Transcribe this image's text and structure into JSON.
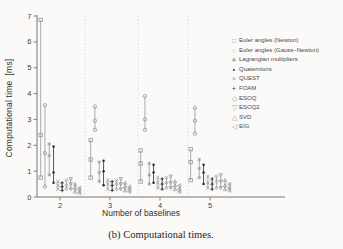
{
  "figure": {
    "caption": "(b) Computational times."
  },
  "chart_data": {
    "type": "scatter",
    "subtype": "errorbar (min / mean / max markers joined by vertical line, per algorithm, grouped by baseline count)",
    "title": "",
    "xlabel": "Number of baselines",
    "ylabel": "Computational time  [ms]",
    "caption": "(b) Computational times.",
    "categories": [
      2,
      3,
      4,
      5
    ],
    "x_ticks": [
      "2",
      "3",
      "4",
      "5"
    ],
    "y_ticks": [
      "0",
      "1",
      "2",
      "3",
      "4",
      "5",
      "6",
      "7"
    ],
    "ylim": [
      0,
      7
    ],
    "xlim": [
      1.55,
      6.5
    ],
    "grid": false,
    "separators_x": [
      2.5,
      3.56,
      4.56
    ],
    "legend_position": "outside upper right",
    "colors": {
      "background": "#fbfaf8",
      "axis": "#6a6a6a",
      "separator": "#bdbdbd",
      "gray_series": "#999999",
      "black_series": "#2b2b2b",
      "tick_label": "#3f3f3f"
    },
    "series": [
      {
        "name": "Euler angles (Newton)",
        "marker": "square",
        "shade": "gray",
        "points_min_mid_max": [
          [
            0.75,
            2.4,
            6.85
          ],
          [
            0.75,
            1.45,
            2.2
          ],
          [
            0.6,
            1.3,
            1.8
          ],
          [
            0.65,
            1.35,
            1.85
          ]
        ]
      },
      {
        "name": "Euler angles (Gauss–Newton)",
        "marker": "circle",
        "shade": "gray",
        "points_min_mid_max": [
          [
            0.4,
            1.7,
            3.55
          ],
          [
            2.6,
            2.95,
            3.5
          ],
          [
            2.6,
            3.0,
            3.9
          ],
          [
            2.45,
            2.95,
            3.45
          ]
        ]
      },
      {
        "name": "Lagrangian multipliers",
        "marker": "asterisk",
        "shade": "gray",
        "points_min_mid_max": [
          [
            0.85,
            1.6,
            2.05
          ],
          [
            0.6,
            0.95,
            1.35
          ],
          [
            0.5,
            0.85,
            1.3
          ],
          [
            0.75,
            1.1,
            1.45
          ]
        ]
      },
      {
        "name": "Quaternions",
        "marker": "point",
        "shade": "black",
        "points_min_mid_max": [
          [
            0.55,
            0.95,
            1.95
          ],
          [
            0.45,
            1.0,
            1.4
          ],
          [
            0.55,
            0.95,
            1.25
          ],
          [
            0.5,
            0.95,
            1.25
          ]
        ]
      },
      {
        "name": "QUEST",
        "marker": "x",
        "shade": "gray",
        "points_min_mid_max": [
          [
            0.3,
            0.45,
            0.6
          ],
          [
            0.3,
            0.5,
            0.65
          ],
          [
            0.35,
            0.55,
            0.75
          ],
          [
            0.35,
            0.55,
            0.8
          ]
        ]
      },
      {
        "name": "FOAM",
        "marker": "plus",
        "shade": "black",
        "points_min_mid_max": [
          [
            0.25,
            0.4,
            0.55
          ],
          [
            0.25,
            0.45,
            0.6
          ],
          [
            0.3,
            0.5,
            0.7
          ],
          [
            0.3,
            0.5,
            0.7
          ]
        ]
      },
      {
        "name": "ESOQ",
        "marker": "diamond",
        "shade": "gray",
        "points_min_mid_max": [
          [
            0.3,
            0.45,
            0.65
          ],
          [
            0.3,
            0.5,
            0.65
          ],
          [
            0.35,
            0.55,
            0.75
          ],
          [
            0.35,
            0.6,
            0.8
          ]
        ]
      },
      {
        "name": "ESOQ2",
        "marker": "triangle-down",
        "shade": "gray",
        "points_min_mid_max": [
          [
            0.3,
            0.5,
            0.7
          ],
          [
            0.3,
            0.5,
            0.7
          ],
          [
            0.35,
            0.55,
            0.8
          ],
          [
            0.35,
            0.6,
            0.85
          ]
        ]
      },
      {
        "name": "SVD",
        "marker": "triangle-up",
        "shade": "gray",
        "points_min_mid_max": [
          [
            0.2,
            0.35,
            0.5
          ],
          [
            0.25,
            0.4,
            0.55
          ],
          [
            0.3,
            0.45,
            0.6
          ],
          [
            0.3,
            0.45,
            0.65
          ]
        ]
      },
      {
        "name": "EIG",
        "marker": "triangle-left",
        "shade": "gray",
        "points_min_mid_max": [
          [
            0.15,
            0.25,
            0.35
          ],
          [
            0.2,
            0.3,
            0.4
          ],
          [
            0.2,
            0.3,
            0.45
          ],
          [
            0.25,
            0.35,
            0.5
          ]
        ]
      }
    ],
    "legend_markers": {
      "square": "□",
      "circle": "○",
      "asterisk": "∗",
      "point": "•",
      "x": "×",
      "plus": "+",
      "diamond": "◇",
      "triangle-down": "▽",
      "triangle-up": "△",
      "triangle-left": "◁"
    }
  }
}
